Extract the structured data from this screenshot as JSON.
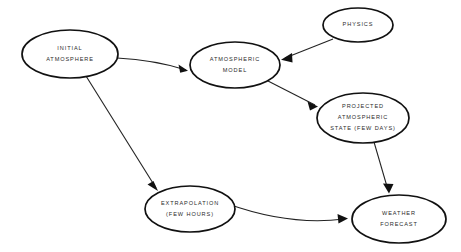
{
  "diagram": {
    "background_color": "#ffffff",
    "stroke_color": "#111111",
    "text_color": "#2b2b2b",
    "nodes": [
      {
        "id": "initial-atmosphere",
        "lines": [
          "INITIAL",
          "ATMOSPHERE"
        ],
        "cx": 70,
        "cy": 54,
        "rx": 48,
        "ry": 24
      },
      {
        "id": "atmospheric-model",
        "lines": [
          "ATMOSPHERIC",
          "MODEL"
        ],
        "cx": 235,
        "cy": 65,
        "rx": 45,
        "ry": 23
      },
      {
        "id": "physics",
        "lines": [
          "PHYSICS"
        ],
        "cx": 358,
        "cy": 25,
        "rx": 35,
        "ry": 17
      },
      {
        "id": "projected-atmospheric-state",
        "lines": [
          "PROJECTED",
          "ATMOSPHERIC",
          "STATE (FEW DAYS)"
        ],
        "cx": 363,
        "cy": 118,
        "rx": 46,
        "ry": 25
      },
      {
        "id": "extrapolation",
        "lines": [
          "EXTRAPOLATION",
          "(FEW HOURS)"
        ],
        "cx": 190,
        "cy": 209,
        "rx": 45,
        "ry": 23
      },
      {
        "id": "weather-forecast",
        "lines": [
          "WEATHER",
          "FORECAST"
        ],
        "cx": 399,
        "cy": 219,
        "rx": 47,
        "ry": 24
      }
    ],
    "edges": [
      {
        "id": "initial-atmosphere-to-atmospheric-model",
        "from": "initial-atmosphere",
        "to": "atmospheric-model",
        "path": "M 117 58 Q 155 60 186 70",
        "head": "188,70.8 178.5,64.5 180.2,72.8"
      },
      {
        "id": "initial-atmosphere-to-extrapolation",
        "from": "initial-atmosphere",
        "to": "extrapolation",
        "path": "M 86 76 L 156 188",
        "head": "158,191 147.5,184.5 153.5,181"
      },
      {
        "id": "physics-to-atmospheric-model",
        "from": "physics",
        "to": "atmospheric-model",
        "path": "M 333 39 L 285 58",
        "head": "281,59.8 292,53 292.5,62.5"
      },
      {
        "id": "atmospheric-model-to-projected-state",
        "from": "atmospheric-model",
        "to": "projected-atmospheric-state",
        "path": "M 268 81 L 315 105",
        "head": "318,106.5 307.5,101.5 310,110.5"
      },
      {
        "id": "projected-state-to-weather-forecast",
        "from": "projected-atmospheric-state",
        "to": "weather-forecast",
        "path": "M 374 142 L 388 190",
        "head": "389,193.5 383,183.5 393.5,184"
      },
      {
        "id": "extrapolation-to-weather-forecast",
        "from": "extrapolation",
        "to": "weather-forecast",
        "path": "M 228 204 Q 290 226 344 219",
        "head": "348,218.5 337.5,214 338.5,223.5"
      }
    ]
  }
}
